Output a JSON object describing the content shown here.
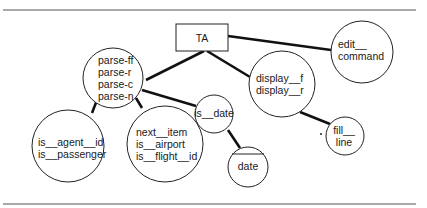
{
  "diagram": {
    "type": "structure-chart",
    "root": {
      "id": "TA",
      "label": "TA",
      "shape": "rectangle"
    },
    "nodes": [
      {
        "id": "parse",
        "lines": [
          "parse-ff",
          "parse-r",
          "parse-c",
          "parse-n"
        ],
        "shape": "circle"
      },
      {
        "id": "display",
        "lines": [
          "display__f",
          "display__r"
        ],
        "shape": "circle"
      },
      {
        "id": "edit_command",
        "lines": [
          "edit__",
          "command"
        ],
        "shape": "circle"
      },
      {
        "id": "is_date",
        "lines": [
          "is__date"
        ],
        "shape": "circle"
      },
      {
        "id": "is_agent",
        "lines": [
          "is__agent__id",
          "is__passenger"
        ],
        "shape": "circle"
      },
      {
        "id": "next_item",
        "lines": [
          "next__item",
          "is__airport",
          "is__flight__id"
        ],
        "shape": "circle"
      },
      {
        "id": "date",
        "lines": [
          "date"
        ],
        "shape": "circle-with-chord"
      },
      {
        "id": "fill_line",
        "lines": [
          "fill__",
          "line"
        ],
        "shape": "circle",
        "marker": "*"
      }
    ],
    "edges": [
      [
        "TA",
        "parse"
      ],
      [
        "TA",
        "display"
      ],
      [
        "TA",
        "edit_command"
      ],
      [
        "parse",
        "is_date"
      ],
      [
        "parse",
        "is_agent"
      ],
      [
        "parse",
        "next_item"
      ],
      [
        "is_date",
        "date"
      ],
      [
        "display",
        "fill_line"
      ]
    ]
  }
}
